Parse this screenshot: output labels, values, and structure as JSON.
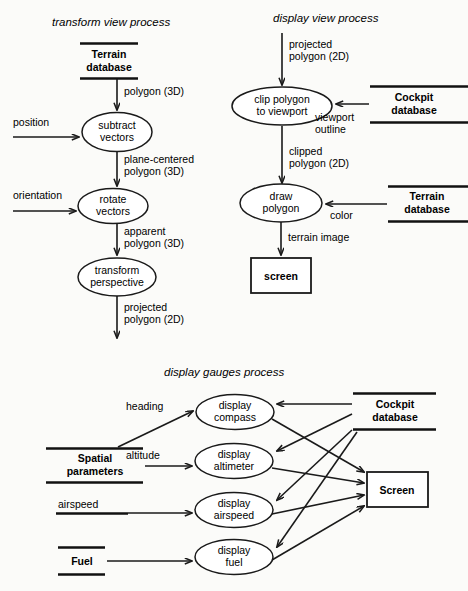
{
  "figure": {
    "type": "data-flow-diagram",
    "background": "#fbfbf9",
    "ink": "#111111",
    "width": 468,
    "height": 591
  },
  "sections": {
    "transform_view": {
      "title_italic": "transform view",
      "title_plain": " process",
      "stores": [
        {
          "id": "terrain-db",
          "line1": "Terrain",
          "line2": "database"
        }
      ],
      "processes": [
        {
          "id": "subtract-vectors",
          "line1": "subtract",
          "line2": "vectors"
        },
        {
          "id": "rotate-vectors",
          "line1": "rotate",
          "line2": "vectors"
        },
        {
          "id": "transform-perspective",
          "line1": "transform",
          "line2": "perspective"
        }
      ],
      "flows": [
        {
          "id": "polygon-3d",
          "line1": "polygon (3D)",
          "line2": ""
        },
        {
          "id": "position",
          "line1": "position",
          "line2": ""
        },
        {
          "id": "plane-centered-polygon-3d",
          "line1": "plane-centered",
          "line2": "polygon (3D)"
        },
        {
          "id": "orientation",
          "line1": "orientation",
          "line2": ""
        },
        {
          "id": "apparent-polygon-3d",
          "line1": "apparent",
          "line2": "polygon (3D)"
        },
        {
          "id": "projected-polygon-2d-out",
          "line1": "projected",
          "line2": "polygon (2D)"
        }
      ]
    },
    "display_view": {
      "title_italic": "display view",
      "title_plain": " process",
      "stores": [
        {
          "id": "cockpit-db",
          "line1": "Cockpit",
          "line2": "database"
        },
        {
          "id": "terrain-db-2",
          "line1": "Terrain",
          "line2": "database"
        }
      ],
      "processes": [
        {
          "id": "clip-polygon",
          "line1": "clip polygon",
          "line2": "to viewport"
        },
        {
          "id": "draw-polygon",
          "line1": "draw",
          "line2": "polygon"
        }
      ],
      "terminators": [
        {
          "id": "screen-lower",
          "label": "screen"
        }
      ],
      "flows": [
        {
          "id": "projected-polygon-2d-in",
          "line1": "projected",
          "line2": "polygon (2D)"
        },
        {
          "id": "viewport-outline",
          "line1": "viewport",
          "line2": "outline"
        },
        {
          "id": "clipped-polygon-2d",
          "line1": "clipped",
          "line2": "polygon (2D)"
        },
        {
          "id": "color",
          "line1": "color",
          "line2": ""
        },
        {
          "id": "terrain-image",
          "line1": "terrain image",
          "line2": ""
        }
      ]
    },
    "display_gauges": {
      "title_italic": "display gauges",
      "title_plain": " process",
      "stores": [
        {
          "id": "cockpit-db-3",
          "line1": "Cockpit",
          "line2": "database"
        },
        {
          "id": "spatial-parameters",
          "line1": "Spatial",
          "line2": "parameters"
        },
        {
          "id": "fuel",
          "line1": "Fuel",
          "line2": ""
        }
      ],
      "processes": [
        {
          "id": "display-compass",
          "line1": "display",
          "line2": "compass"
        },
        {
          "id": "display-altimeter",
          "line1": "display",
          "line2": "altimeter"
        },
        {
          "id": "display-airspeed",
          "line1": "display",
          "line2": "airspeed"
        },
        {
          "id": "display-fuel",
          "line1": "display",
          "line2": "fuel"
        }
      ],
      "terminators": [
        {
          "id": "screen-gauges",
          "label": "Screen"
        }
      ],
      "flows": [
        {
          "id": "heading",
          "line1": "heading",
          "line2": ""
        },
        {
          "id": "altitude",
          "line1": "altitude",
          "line2": ""
        },
        {
          "id": "airspeed",
          "line1": "airspeed",
          "line2": ""
        }
      ]
    }
  }
}
